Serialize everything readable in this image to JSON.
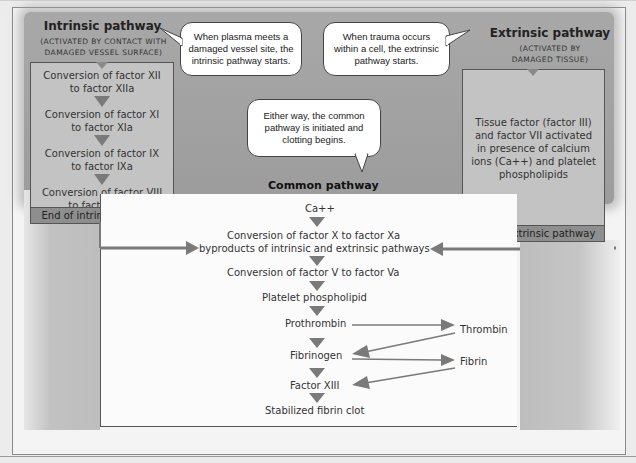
{
  "diagram": {
    "intrinsic": {
      "title": "Intrinsic pathway",
      "subtitle_line1": "(ACTIVATED BY CONTACT WITH",
      "subtitle_line2": "DAMAGED VESSEL SURFACE)",
      "steps": [
        {
          "line1": "Conversion of factor XII",
          "line2": "to factor XIIa"
        },
        {
          "line1": "Conversion of factor XI",
          "line2": "to factor XIa"
        },
        {
          "line1": "Conversion of factor IX",
          "line2": "to factor IXa"
        },
        {
          "line1": "Conversion of factor VIII",
          "line2": "to factor VIIIa"
        }
      ],
      "end_label": "End of intrinsic pathway"
    },
    "extrinsic": {
      "title": "Extrinsic pathway",
      "subtitle_line1": "(ACTIVATED BY",
      "subtitle_line2": "DAMAGED TISSUE)",
      "step_lines": [
        "Tissue factor (factor III)",
        "and factor VII activated",
        "in presence of calcium",
        "ions (Ca++) and platelet",
        "phospholipids"
      ],
      "end_label": "End of extrinsic pathway"
    },
    "bubbles": {
      "intrinsic_note": [
        "When plasma meets a",
        "damaged vessel site, the",
        "intrinsic pathway starts."
      ],
      "extrinsic_note": [
        "When trauma occurs",
        "within a cell, the extrinsic",
        "pathway starts."
      ],
      "common_note": [
        "Either way, the common",
        "pathway is initiated and",
        "clotting begins."
      ]
    },
    "common": {
      "title": "Common pathway",
      "ca": "Ca++",
      "factor_x_line1": "Conversion of factor X to factor Xa",
      "factor_x_line2": "byproducts of intrinsic and extrinsic pathways",
      "factor_v": "Conversion of factor V to factor Va",
      "platelet": "Platelet phospholipid",
      "prothrombin": "Prothrombin",
      "thrombin": "Thrombin",
      "fibrinogen": "Fibrinogen",
      "fibrin": "Fibrin",
      "factor_xiii": "Factor XIII",
      "clot": "Stabilized fibrin clot"
    },
    "colors": {
      "band_gray": "#a4a4a4",
      "box_gray": "#c3c3c3",
      "end_bar_gray": "#8e8e8e",
      "arrow_gray": "#7a7a7a"
    }
  }
}
